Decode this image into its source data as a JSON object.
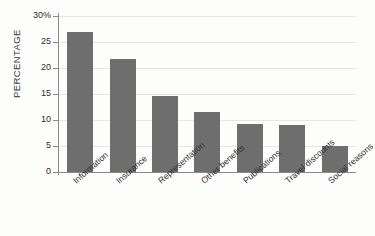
{
  "chart_data": {
    "type": "bar",
    "title": "",
    "subtitle": "",
    "xlabel": "",
    "ylabel": "PERCENTAGE",
    "categories": [
      "Information",
      "Insurance",
      "Representation",
      "Other benefits",
      "Publications",
      "Travel discounts",
      "Social reasons"
    ],
    "values": [
      26.9,
      21.7,
      14.6,
      11.5,
      9.2,
      9.1,
      5.0
    ],
    "ylim": [
      0,
      30
    ],
    "yticks": [
      0,
      5,
      10,
      15,
      20,
      25,
      30
    ],
    "ytick_labels": [
      "0",
      "5",
      "10",
      "15",
      "20",
      "25",
      "30%"
    ],
    "grid": true,
    "legend": "none",
    "bar_color": "#6e6e6e",
    "gridline_color": "#e6e6e4",
    "axis_color": "#8a8a8a",
    "background_color": "#fdfdfb",
    "text_color": "#2e2e2e"
  }
}
